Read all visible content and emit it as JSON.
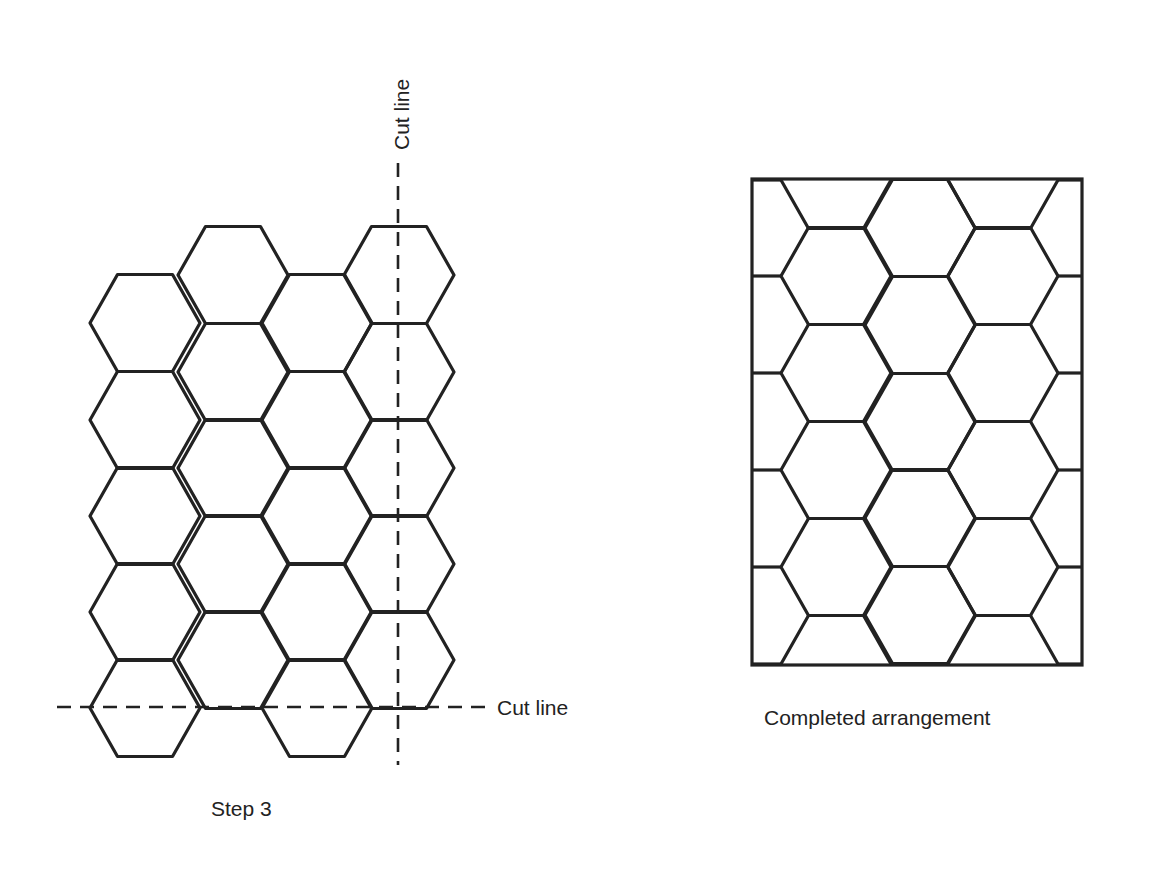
{
  "left_panel": {
    "caption": "Step 3",
    "vertical_cut_label": "Cut line",
    "horizontal_cut_label": "Cut line",
    "hex": {
      "side": 55,
      "height": 97
    },
    "columns": [
      {
        "cx": 145,
        "rows_cy": [
          323,
          420,
          516,
          612,
          708
        ]
      },
      {
        "cx": 233,
        "rows_cy": [
          275,
          372,
          468,
          564,
          660
        ]
      },
      {
        "cx": 317,
        "rows_cy": [
          323,
          420,
          516,
          612,
          708
        ]
      },
      {
        "cx": 399,
        "rows_cy": [
          275,
          372,
          468,
          564,
          660
        ]
      }
    ],
    "vertical_cut_x": 398,
    "horizontal_cut_y": 707
  },
  "right_panel": {
    "caption": "Completed arrangement",
    "frame": {
      "x": 752,
      "y": 179,
      "width": 330,
      "height": 486
    },
    "columns": [
      {
        "cx": 836,
        "rows_cy": [
          180,
          276,
          373,
          470,
          567,
          664
        ]
      },
      {
        "cx": 920,
        "rows_cy": [
          228,
          325,
          422,
          518,
          615
        ]
      },
      {
        "cx": 1003,
        "rows_cy": [
          180,
          276,
          373,
          470,
          567,
          664
        ]
      }
    ]
  },
  "colors": {
    "line": "#222222",
    "background": "#ffffff"
  }
}
